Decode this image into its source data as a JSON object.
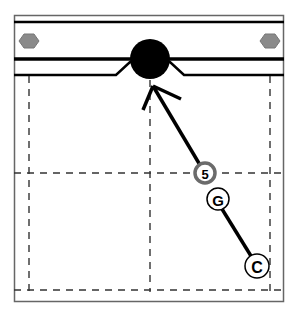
{
  "diagram": {
    "type": "play-diagram",
    "colors": {
      "background": "#ffffff",
      "line": "#000000",
      "frame": "#555555",
      "dash": "#333333",
      "hexagon": "#8a8a8a",
      "player_highlight": "#6b6b6b"
    },
    "puck": {
      "icon": "puck-icon",
      "cx": 150,
      "cy": 59,
      "r": 20
    },
    "goal_markers": [
      {
        "icon": "hexagon-icon",
        "cx": 29,
        "cy": 41
      },
      {
        "icon": "hexagon-icon",
        "cx": 270,
        "cy": 41
      }
    ],
    "players": [
      {
        "label": "5",
        "cx": 205,
        "cy": 173,
        "r": 10,
        "highlighted": true
      },
      {
        "label": "G",
        "cx": 218,
        "cy": 199,
        "r": 11,
        "highlighted": false
      },
      {
        "label": "C",
        "cx": 257,
        "cy": 266,
        "r": 12,
        "highlighted": false
      }
    ],
    "arrow": {
      "from": "5",
      "to": "puck"
    }
  }
}
